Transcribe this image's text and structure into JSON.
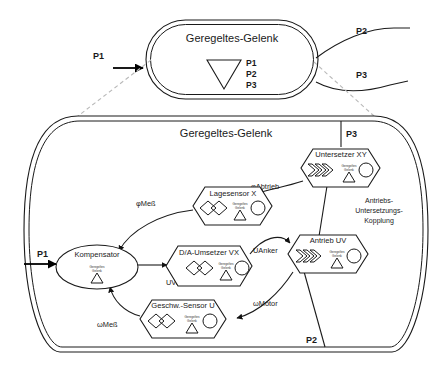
{
  "diagram": {
    "type": "block-diagram",
    "language": "de",
    "top_module": {
      "title": "Geregeltes-Gelenk",
      "symbol": "triangle-down",
      "ports": [
        "P1",
        "P2",
        "P3"
      ],
      "external_port_labels": {
        "left": "P1",
        "upper_right": "P2",
        "lower_right": "P3"
      }
    },
    "detail_view": {
      "title": "Geregeltes-Gelenk",
      "port_labels": {
        "left": "P1",
        "top_right": "P3",
        "bottom_right": "P2"
      },
      "coupling_label": "Antriebs-\nUntersetzungs-\nKopplung",
      "coupling_lines": [
        "Antriebs-",
        "Untersetzungs-",
        "Kopplung"
      ],
      "inner_tag_line1": "Geregeltes",
      "inner_tag_line2": "Gelenk",
      "nodes": [
        {
          "id": "kompensator",
          "label": "Kompensator",
          "shape": "ellipse",
          "icon": "none"
        },
        {
          "id": "da-umsetzer",
          "label": "D/A-Umsetzer VX",
          "shape": "hexagon",
          "icon": "two-diamonds"
        },
        {
          "id": "antrieb",
          "label": "Antrieb UV",
          "shape": "hexagon",
          "icon": "chevron-stack"
        },
        {
          "id": "untersetzer",
          "label": "Untersetzer XY",
          "shape": "hexagon",
          "icon": "chevron-stack"
        },
        {
          "id": "lagesensor",
          "label": "Lagesensor X",
          "shape": "hexagon",
          "icon": "two-diamonds"
        },
        {
          "id": "geschw-sensor",
          "label": "Geschw.-Sensor U",
          "shape": "hexagon",
          "icon": "two-diamonds"
        }
      ],
      "signals": [
        {
          "id": "u-vor",
          "label": "UVor",
          "from": "kompensator",
          "to": "da-umsetzer"
        },
        {
          "id": "u-anker",
          "label": "UAnker",
          "from": "da-umsetzer",
          "to": "antrieb"
        },
        {
          "id": "phi-abtrieb",
          "label": "φAbtrieb",
          "from": "untersetzer",
          "to": "lagesensor"
        },
        {
          "id": "phi-mess",
          "label": "φMeß",
          "from": "lagesensor",
          "to": "kompensator"
        },
        {
          "id": "omega-motor",
          "label": "ωMotor",
          "from": "antrieb",
          "to": "geschw-sensor"
        },
        {
          "id": "omega-mess",
          "label": "ωMeß",
          "from": "geschw-sensor",
          "to": "kompensator"
        }
      ]
    }
  }
}
